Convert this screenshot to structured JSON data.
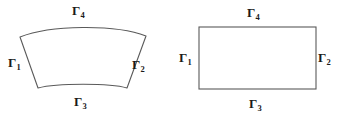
{
  "figure": {
    "background_color": "#ffffff",
    "stroke_color": "#5a5a5a",
    "label_color": "#1a1a1a",
    "shapes": [
      {
        "name": "curved-quadrilateral",
        "kind": "annular-sector",
        "description": "curvilinear quadrilateral (physical domain)",
        "corners": [
          [
            20,
            37
          ],
          [
            146,
            36
          ],
          [
            127,
            88
          ],
          [
            38,
            88
          ]
        ],
        "boundary_labels": {
          "left": "Γ",
          "left_sub": "1",
          "right": "Γ",
          "right_sub": "2",
          "bottom": "Γ",
          "bottom_sub": "3",
          "top": "Γ",
          "top_sub": "4"
        }
      },
      {
        "name": "rectangle",
        "kind": "rectangle",
        "description": "reference rectangular domain",
        "corners": [
          [
            199,
            27
          ],
          [
            316,
            27
          ],
          [
            316,
            89
          ],
          [
            199,
            89
          ]
        ],
        "boundary_labels": {
          "left": "Γ",
          "left_sub": "1",
          "right": "Γ",
          "right_sub": "2",
          "bottom": "Γ",
          "bottom_sub": "3",
          "top": "Γ",
          "top_sub": "4"
        }
      }
    ],
    "labels": {
      "curved_gamma1": "Γ",
      "curved_gamma1_sub": "1",
      "curved_gamma2": "Γ",
      "curved_gamma2_sub": "2",
      "curved_gamma3": "Γ",
      "curved_gamma3_sub": "3",
      "curved_gamma4": "Γ",
      "curved_gamma4_sub": "4",
      "rect_gamma1": "Γ",
      "rect_gamma1_sub": "1",
      "rect_gamma2": "Γ",
      "rect_gamma2_sub": "2",
      "rect_gamma3": "Γ",
      "rect_gamma3_sub": "3",
      "rect_gamma4": "Γ",
      "rect_gamma4_sub": "4"
    }
  }
}
